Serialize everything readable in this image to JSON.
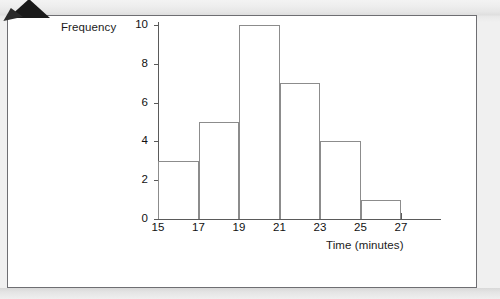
{
  "figure": {
    "corner_artifact": "folded-corner-mark"
  },
  "chart_data": {
    "type": "bar",
    "title": "",
    "subtitle": "",
    "xlabel": "Time (minutes)",
    "ylabel": "Frequency",
    "categories": [
      "15-17",
      "17-19",
      "19-21",
      "21-23",
      "23-25",
      "25-27"
    ],
    "bin_edges": [
      15,
      17,
      19,
      21,
      23,
      25,
      27
    ],
    "values": [
      3,
      5,
      10,
      7,
      4,
      1
    ],
    "x_tick_labels": [
      "15",
      "17",
      "19",
      "21",
      "23",
      "25",
      "27"
    ],
    "y_tick_labels": [
      "0",
      "2",
      "4",
      "6",
      "8",
      "10"
    ],
    "y_tick_values": [
      0,
      2,
      4,
      6,
      8,
      10
    ],
    "xlim": [
      15,
      27
    ],
    "ylim": [
      0,
      10
    ],
    "grid": false,
    "legend": null,
    "bar_fill": "#ffffff",
    "bar_stroke": "#8c8c8c",
    "axis_color": "#5a5a5a",
    "text_color": "#111111",
    "background": "#ffffff"
  }
}
